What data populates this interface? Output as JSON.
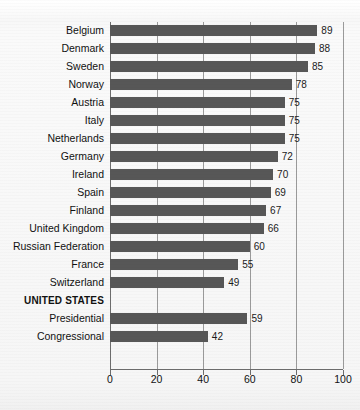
{
  "chart_data": {
    "type": "bar",
    "orientation": "horizontal",
    "title": "",
    "subtitle": "",
    "xlabel": "",
    "ylabel": "",
    "xlim": [
      0,
      100
    ],
    "xticks": [
      0,
      20,
      40,
      60,
      80,
      100
    ],
    "xtick_labels": [
      "0",
      "20",
      "40",
      "60",
      "80",
      "100"
    ],
    "grid": "vertical",
    "legend": "none",
    "bar_color": "#575757",
    "gridline_color": "#9a9a9a",
    "axis_color": "#6d6d6d",
    "categories": [
      "Belgium",
      "Denmark",
      "Sweden",
      "Norway",
      "Austria",
      "Italy",
      "Netherlands",
      "Germany",
      "Ireland",
      "Spain",
      "Finland",
      "United Kingdom",
      "Russian Federation",
      "France",
      "Switzerland",
      "UNITED STATES",
      "Presidential",
      "Congressional"
    ],
    "values": [
      89,
      88,
      85,
      78,
      75,
      75,
      75,
      72,
      70,
      69,
      67,
      66,
      60,
      55,
      49,
      null,
      59,
      42
    ],
    "rows": [
      {
        "label": "Belgium",
        "value": 89,
        "value_label": "89",
        "is_group_header": false
      },
      {
        "label": "Denmark",
        "value": 88,
        "value_label": "88",
        "is_group_header": false
      },
      {
        "label": "Sweden",
        "value": 85,
        "value_label": "85",
        "is_group_header": false
      },
      {
        "label": "Norway",
        "value": 78,
        "value_label": "78",
        "is_group_header": false
      },
      {
        "label": "Austria",
        "value": 75,
        "value_label": "75",
        "is_group_header": false
      },
      {
        "label": "Italy",
        "value": 75,
        "value_label": "75",
        "is_group_header": false
      },
      {
        "label": "Netherlands",
        "value": 75,
        "value_label": "75",
        "is_group_header": false
      },
      {
        "label": "Germany",
        "value": 72,
        "value_label": "72",
        "is_group_header": false
      },
      {
        "label": "Ireland",
        "value": 70,
        "value_label": "70",
        "is_group_header": false
      },
      {
        "label": "Spain",
        "value": 69,
        "value_label": "69",
        "is_group_header": false
      },
      {
        "label": "Finland",
        "value": 67,
        "value_label": "67",
        "is_group_header": false
      },
      {
        "label": "United Kingdom",
        "value": 66,
        "value_label": "66",
        "is_group_header": false
      },
      {
        "label": "Russian Federation",
        "value": 60,
        "value_label": "60",
        "is_group_header": false
      },
      {
        "label": "France",
        "value": 55,
        "value_label": "55",
        "is_group_header": false
      },
      {
        "label": "Switzerland",
        "value": 49,
        "value_label": "49",
        "is_group_header": false
      },
      {
        "label": "UNITED STATES",
        "value": null,
        "value_label": "",
        "is_group_header": true
      },
      {
        "label": "Presidential",
        "value": 59,
        "value_label": "59",
        "is_group_header": false
      },
      {
        "label": "Congressional",
        "value": 42,
        "value_label": "42",
        "is_group_header": false
      }
    ]
  }
}
